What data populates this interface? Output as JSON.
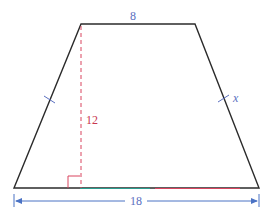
{
  "diagram": {
    "type": "isosceles-trapezoid",
    "labels": {
      "top_base": "8",
      "height": "12",
      "bottom_base": "18",
      "side": "x"
    },
    "colors": {
      "outline": "#2b2b2b",
      "dimension_blue": "#4a72c4",
      "height_red": "#d9455f",
      "label_blue": "#5a6fc0",
      "label_red": "#c8374f",
      "base_accent_teal": "#2a9d8f"
    },
    "marks": {
      "equal_side_ticks": 2,
      "right_angle_marker": true,
      "dimension_arrows": true
    }
  }
}
